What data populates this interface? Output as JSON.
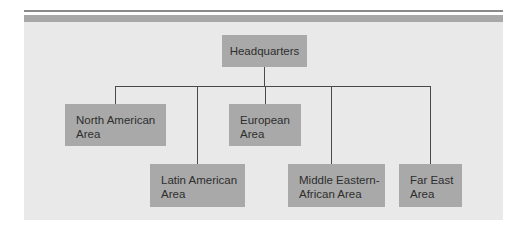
{
  "diagram": {
    "type": "org-chart",
    "root": {
      "label": "Headquarters"
    },
    "children": [
      {
        "label_line1": "North American",
        "label_line2": "Area"
      },
      {
        "label_line1": "Latin American",
        "label_line2": "Area"
      },
      {
        "label_line1": "European",
        "label_line2": "Area"
      },
      {
        "label_line1": "Middle Eastern-",
        "label_line2": "African Area"
      },
      {
        "label_line1": "Far East",
        "label_line2": "Area"
      }
    ],
    "colors": {
      "panel": "#e9e9e9",
      "box": "#a9a9a9",
      "connector": "#4a4a4a",
      "text": "#2e2e2e"
    }
  }
}
